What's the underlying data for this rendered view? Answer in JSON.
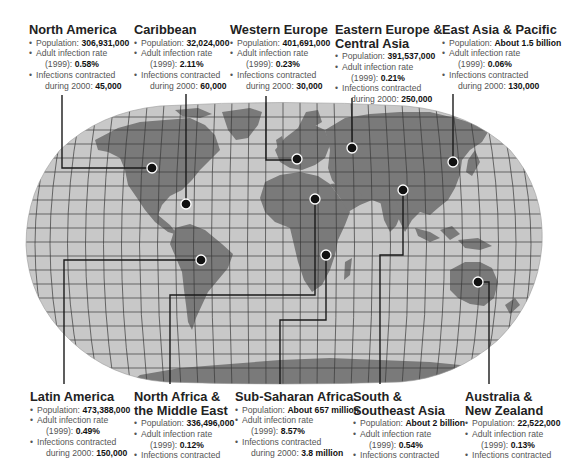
{
  "map": {
    "title_hidden": "",
    "projection": "Robinson-style world map with graticule",
    "colors": {
      "background": "#ffffff",
      "ocean": "#c8c8c8",
      "land": "#7a7a7a",
      "graticule": "#3a3a3a",
      "leader_line": "#1a1a1a",
      "marker_fill": "#111111",
      "marker_ring": "#ffffff"
    }
  },
  "regions": [
    {
      "id": "north-america",
      "name": "North America",
      "population_label": "Population:",
      "population": "306,931,000",
      "rate_label": "Adult infection rate",
      "rate_year": "(1999):",
      "rate": "0.58%",
      "infections_label": "Infections contracted",
      "infections_year": "during 2000:",
      "infections": "45,000"
    },
    {
      "id": "caribbean",
      "name": "Caribbean",
      "population_label": "Population:",
      "population": "32,024,000",
      "rate_label": "Adult infection rate",
      "rate_year": "(1999):",
      "rate": "2.11%",
      "infections_label": "Infections contracted",
      "infections_year": "during 2000:",
      "infections": "60,000"
    },
    {
      "id": "western-europe",
      "name": "Western Europe",
      "population_label": "Population:",
      "population": "401,691,000",
      "rate_label": "Adult infection rate",
      "rate_year": "(1999):",
      "rate": "0.23%",
      "infections_label": "Infections contracted",
      "infections_year": "during 2000:",
      "infections": "30,000"
    },
    {
      "id": "eastern-europe-central-asia",
      "name_line1": "Eastern Europe &",
      "name_line2": "Central Asia",
      "population_label": "Population:",
      "population": "391,537,000",
      "rate_label": "Adult infection rate",
      "rate_year": "(1999):",
      "rate": "0.21%",
      "infections_label": "Infections contracted",
      "infections_year": "during 2000:",
      "infections": "250,000"
    },
    {
      "id": "east-asia-pacific",
      "name": "East Asia & Pacific",
      "population_label": "Population:",
      "population": "About 1.5 billion",
      "rate_label": "Adult infection rate",
      "rate_year": "(1999):",
      "rate": "0.06%",
      "infections_label": "Infections contracted",
      "infections_year": "during 2000:",
      "infections": "130,000"
    },
    {
      "id": "latin-america",
      "name": "Latin America",
      "population_label": "Population:",
      "population": "473,388,000",
      "rate_label": "Adult infection rate",
      "rate_year": "(1999):",
      "rate": "0.49%",
      "infections_label": "Infections contracted",
      "infections_year": "during 2000:",
      "infections": "150,000"
    },
    {
      "id": "north-africa-middle-east",
      "name_line1": "North Africa &",
      "name_line2": "the Middle East",
      "population_label": "Population:",
      "population": "336,496,000",
      "rate_label": "Adult infection rate",
      "rate_year": "(1999):",
      "rate": "0.12%",
      "infections_label": "Infections contracted"
    },
    {
      "id": "sub-saharan-africa",
      "name": "Sub-Saharan Africa",
      "population_label": "Population:",
      "population": "About 657 million",
      "rate_label": "Adult infection rate",
      "rate_year": "(1999):",
      "rate": "8.57%",
      "infections_label": "Infections contracted",
      "infections_year": "during 2000:",
      "infections": "3.8 million"
    },
    {
      "id": "south-southeast-asia",
      "name_line1": "South &",
      "name_line2": "Southeast Asia",
      "population_label": "Population:",
      "population": "About 2 billion",
      "rate_label": "Adult infection rate",
      "rate_year": "(1999):",
      "rate": "0.54%",
      "infections_label": "Infections contracted"
    },
    {
      "id": "australia-new-zealand",
      "name_line1": "Australia &",
      "name_line2": "New Zealand",
      "population_label": "Population:",
      "population": "22,522,000",
      "rate_label": "Adult infection rate",
      "rate_year": "(1999):",
      "rate": "0.13%",
      "infections_label": "Infections contracted"
    }
  ]
}
